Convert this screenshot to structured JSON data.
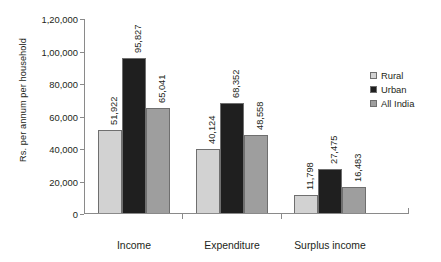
{
  "chart_data": {
    "type": "bar",
    "title": "",
    "subtitle": "",
    "xlabel": "",
    "ylabel": "Rs. per annum per household",
    "categories": [
      "Income",
      "Expenditure",
      "Surplus income"
    ],
    "series": [
      {
        "name": "Rural",
        "color": "#d2d2d2",
        "values": [
          51922,
          40124,
          11798
        ],
        "labels": [
          "51,922",
          "40,124",
          "11,798"
        ]
      },
      {
        "name": "Urban",
        "color": "#1f1f1f",
        "values": [
          95827,
          68352,
          27475
        ],
        "labels": [
          "95,827",
          "68,352",
          "27,475"
        ]
      },
      {
        "name": "All India",
        "color": "#9e9e9e",
        "values": [
          65041,
          48558,
          16483
        ],
        "labels": [
          "65,041",
          "48,558",
          "16,483"
        ]
      }
    ],
    "ylim": [
      0,
      120000
    ],
    "ytick_values": [
      0,
      20000,
      40000,
      60000,
      80000,
      100000,
      120000
    ],
    "ytick_labels": [
      "0",
      "20,000",
      "40,000",
      "60,000",
      "80,000",
      "1,00,000",
      "1,20,000"
    ],
    "grid": false,
    "legend_position": "right",
    "axis_color": "#8a8a8a",
    "bar_outline_color": "#6f6f6f",
    "text_color": "#231f20",
    "background": "#ffffff"
  }
}
